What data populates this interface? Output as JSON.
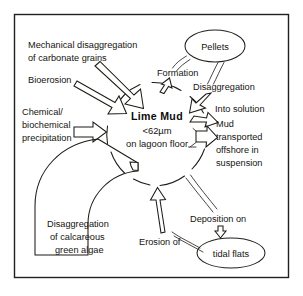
{
  "figure": {
    "type": "cycle-diagram",
    "frame": {
      "border_color": "#20201c"
    },
    "background_color": "#ffffff",
    "ink_color": "#1d1b16"
  },
  "center": {
    "name": "lime-mud",
    "title": "Lime Mud",
    "size_line": "<62µm",
    "location_line": "on lagoon floor"
  },
  "sources": [
    {
      "id": "mechanical",
      "label_line1": "Mechanical disaggregation",
      "label_line2": "of carbonate grains",
      "direction": "into-lime-mud"
    },
    {
      "id": "bioerosion",
      "label_line1": "Bioerosion",
      "label_line2": "",
      "direction": "into-lime-mud"
    },
    {
      "id": "chemical",
      "label_line1": "Chemical/",
      "label_line2": "biochemical",
      "label_line3": "precipitation",
      "direction": "into-lime-mud"
    },
    {
      "id": "green-algae",
      "label_line1": "Disaggregation",
      "label_line2": "of calcareous",
      "label_line3": "green algae",
      "direction": "into-lime-mud"
    }
  ],
  "pathways": [
    {
      "id": "formation",
      "label": "Formation",
      "direction": "lime-mud-to-pellets"
    },
    {
      "id": "disaggregation",
      "label": "Disaggregation",
      "direction": "pellets-to-lime-mud"
    },
    {
      "id": "into-solution",
      "label": "Into solution",
      "direction": "out-of-lime-mud"
    },
    {
      "id": "mud-transport",
      "label_line1": "Mud",
      "label_line2": "transported",
      "label_line3": "offshore in",
      "label_line4": "suspension",
      "direction": "out-of-lime-mud"
    },
    {
      "id": "deposition",
      "label": "Deposition on",
      "direction": "lime-mud-to-tidal-flats"
    },
    {
      "id": "erosion",
      "label": "Erosion of",
      "direction": "tidal-flats-to-lime-mud"
    }
  ],
  "nodes": [
    {
      "id": "pellets",
      "label": "Pellets",
      "shape": "ellipse"
    },
    {
      "id": "tidal-flats",
      "label": "tidal flats",
      "shape": "ellipse"
    }
  ]
}
